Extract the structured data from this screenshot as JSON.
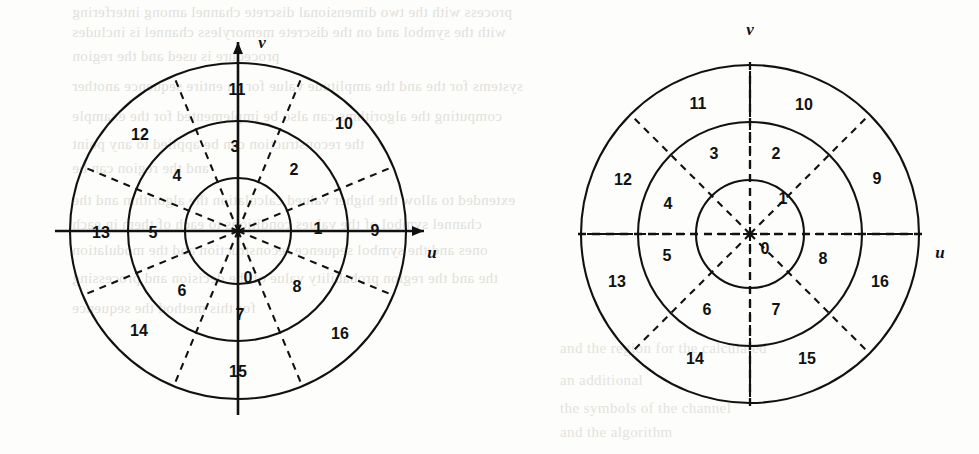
{
  "figure": {
    "caption": "",
    "width": 979,
    "height": 454,
    "background_color": "#fdfdfb",
    "ink_color": "#111111",
    "bleed_color": "#c9c9c4"
  },
  "bleed_text": {
    "lines": [
      {
        "text": "process with the two dimensional discrete channel among interfering",
        "x": 72,
        "y": 4
      },
      {
        "text": "with the symbol and on the discrete memoryless channel is includes",
        "x": 72,
        "y": 24
      },
      {
        "text": "procedure is used and the region",
        "x": 72,
        "y": 48
      },
      {
        "text": "systems for the and the amplitude value for an entire sequence another",
        "x": 72,
        "y": 78
      },
      {
        "text": "computing the algorithms can also be implemented for the example",
        "x": 72,
        "y": 108
      },
      {
        "text": "the reconstruction can be applied to any point",
        "x": 72,
        "y": 136
      },
      {
        "text": "and the region can be",
        "x": 72,
        "y": 160
      },
      {
        "text": "extended to allow the higher valued calculation the algorithm and the",
        "x": 72,
        "y": 192
      },
      {
        "text": "channel symbol of the values conditions to each of them in each",
        "x": 72,
        "y": 216
      },
      {
        "text": "ones and the symbol sequence reconstruction and the modulation",
        "x": 72,
        "y": 242
      },
      {
        "text": "the and the region probability value of the decision and processing",
        "x": 72,
        "y": 270
      },
      {
        "text": "for this method the sequence",
        "x": 72,
        "y": 300
      }
    ],
    "right_lines": [
      {
        "text": "and the region for the calculated",
        "x": 560,
        "y": 340
      },
      {
        "text": "an additional",
        "x": 560,
        "y": 372
      },
      {
        "text": "the symbols of the channel",
        "x": 560,
        "y": 400
      },
      {
        "text": "and the algorithm",
        "x": 560,
        "y": 424
      }
    ]
  },
  "chart_data": {
    "type": "diagram",
    "diagrams": [
      {
        "id": "left-diagram",
        "name": "non-uniform-polar-partition",
        "center": {
          "x": 238,
          "y": 231
        },
        "radii": [
          53,
          110,
          168
        ],
        "axes": {
          "horizontal_label": "u",
          "vertical_label": "v",
          "style": "solid-arrow",
          "u_label_pos": {
            "x": 432,
            "y": 258
          },
          "v_label_pos": {
            "x": 262,
            "y": 48
          }
        },
        "dashed_radial_angles_deg": [
          22.5,
          67.5,
          112.5,
          157.5,
          202.5,
          247.5,
          292.5,
          337.5
        ],
        "region_labels": [
          {
            "text": "0",
            "x": 248,
            "y": 283
          },
          {
            "text": "1",
            "x": 318,
            "y": 234
          },
          {
            "text": "2",
            "x": 294,
            "y": 175
          },
          {
            "text": "3",
            "x": 235,
            "y": 152
          },
          {
            "text": "4",
            "x": 177,
            "y": 181
          },
          {
            "text": "5",
            "x": 153,
            "y": 238
          },
          {
            "text": "6",
            "x": 182,
            "y": 296
          },
          {
            "text": "7",
            "x": 240,
            "y": 320
          },
          {
            "text": "8",
            "x": 297,
            "y": 292
          },
          {
            "text": "9",
            "x": 375,
            "y": 236
          },
          {
            "text": "10",
            "x": 344,
            "y": 129
          },
          {
            "text": "11",
            "x": 237,
            "y": 95
          },
          {
            "text": "12",
            "x": 140,
            "y": 140
          },
          {
            "text": "13",
            "x": 101,
            "y": 238
          },
          {
            "text": "14",
            "x": 139,
            "y": 336
          },
          {
            "text": "15",
            "x": 238,
            "y": 377
          },
          {
            "text": "16",
            "x": 340,
            "y": 339
          }
        ]
      },
      {
        "id": "right-diagram",
        "name": "uniform-polar-partition",
        "center": {
          "x": 750,
          "y": 234
        },
        "radii": [
          54,
          112,
          169
        ],
        "axes": {
          "horizontal_label": "u",
          "vertical_label": "v",
          "style": "dashed-no-arrow",
          "u_label_pos": {
            "x": 940,
            "y": 258
          },
          "v_label_pos": {
            "x": 750,
            "y": 35
          }
        },
        "dashed_radial_angles_deg": [
          0,
          45,
          90,
          135,
          180,
          225,
          270,
          315
        ],
        "region_labels": [
          {
            "text": "0",
            "x": 765,
            "y": 254
          },
          {
            "text": "1",
            "x": 783,
            "y": 204
          },
          {
            "text": "2",
            "x": 776,
            "y": 159
          },
          {
            "text": "3",
            "x": 714,
            "y": 159
          },
          {
            "text": "4",
            "x": 668,
            "y": 209
          },
          {
            "text": "5",
            "x": 667,
            "y": 261
          },
          {
            "text": "6",
            "x": 707,
            "y": 315
          },
          {
            "text": "7",
            "x": 776,
            "y": 315
          },
          {
            "text": "8",
            "x": 823,
            "y": 264
          },
          {
            "text": "9",
            "x": 877,
            "y": 184
          },
          {
            "text": "10",
            "x": 804,
            "y": 110
          },
          {
            "text": "11",
            "x": 698,
            "y": 109
          },
          {
            "text": "12",
            "x": 623,
            "y": 185
          },
          {
            "text": "13",
            "x": 617,
            "y": 287
          },
          {
            "text": "14",
            "x": 695,
            "y": 364
          },
          {
            "text": "15",
            "x": 807,
            "y": 364
          },
          {
            "text": "16",
            "x": 880,
            "y": 287
          }
        ]
      }
    ]
  }
}
